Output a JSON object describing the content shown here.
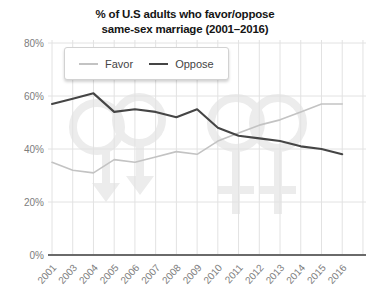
{
  "title": {
    "line1": "% of U.S adults who favor/oppose",
    "line2": "same-sex marriage (2001–2016)"
  },
  "legend": {
    "items": [
      "Favor",
      "Oppose"
    ]
  },
  "chart_data": {
    "type": "line",
    "title": "% of U.S adults who favor/oppose same-sex marriage (2001–2016)",
    "x": [
      "2001",
      "2003",
      "2004",
      "2005",
      "2006",
      "2007",
      "2008",
      "2009",
      "2010",
      "2011",
      "2012",
      "2013",
      "2014",
      "2015",
      "2016"
    ],
    "series": [
      {
        "name": "Favor",
        "color": "#c3c3c3",
        "width": 1.6,
        "values": [
          35,
          32,
          31,
          36,
          35,
          37,
          39,
          38,
          43,
          46,
          49,
          51,
          54,
          57,
          57
        ]
      },
      {
        "name": "Oppose",
        "color": "#454545",
        "width": 2.1,
        "values": [
          57,
          59,
          61,
          54,
          55,
          54,
          52,
          55,
          48,
          45,
          44,
          43,
          41,
          40,
          38
        ]
      }
    ],
    "xlabel": "",
    "ylabel": "",
    "ylim": [
      0,
      80
    ],
    "yticks": [
      0,
      20,
      40,
      60,
      80
    ],
    "ytick_suffix": "%",
    "grid": true,
    "legend_position": "top-left-inset",
    "watermark": "interlocked gender-symbol couples (light gray)"
  },
  "style": {
    "grid_color": "#e2e2e2",
    "axis_color": "#6a6a6a",
    "tick_label_color": "#7d7d7d",
    "watermark_color": "#ececec",
    "background": "#ffffff"
  }
}
